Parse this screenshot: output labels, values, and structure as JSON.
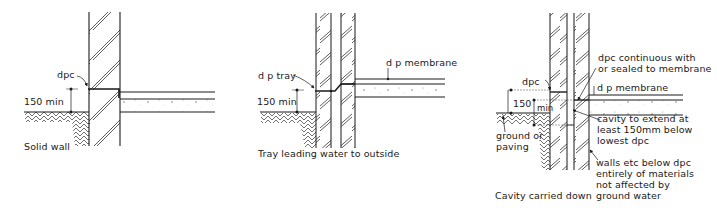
{
  "figure": {
    "panels": [
      {
        "id": "solid-wall",
        "caption": "Solid wall",
        "labels": {
          "dpc": "dpc",
          "height": "150 min"
        }
      },
      {
        "id": "tray",
        "caption": "Tray leading water to outside",
        "labels": {
          "dp_tray": "d p tray",
          "dp_membrane": "d p membrane",
          "height": "150 min"
        }
      },
      {
        "id": "cavity-carried-down",
        "caption": "Cavity carried down",
        "labels": {
          "dpc": "dpc",
          "height_num": "150",
          "height_unit": "min",
          "dpc_continuous": "dpc continuous with\nor sealed to membrane",
          "dp_membrane": "d p membrane",
          "cavity_extend": "cavity to extend at\nleast 150mm below\nlowest dpc",
          "ground": "ground or\npaving",
          "walls_below": "walls etc below dpc\nentirely of materials\nnot affected by\nground water"
        }
      }
    ],
    "colors": {
      "ink": "#1a1a1a",
      "background": "#ffffff"
    }
  }
}
